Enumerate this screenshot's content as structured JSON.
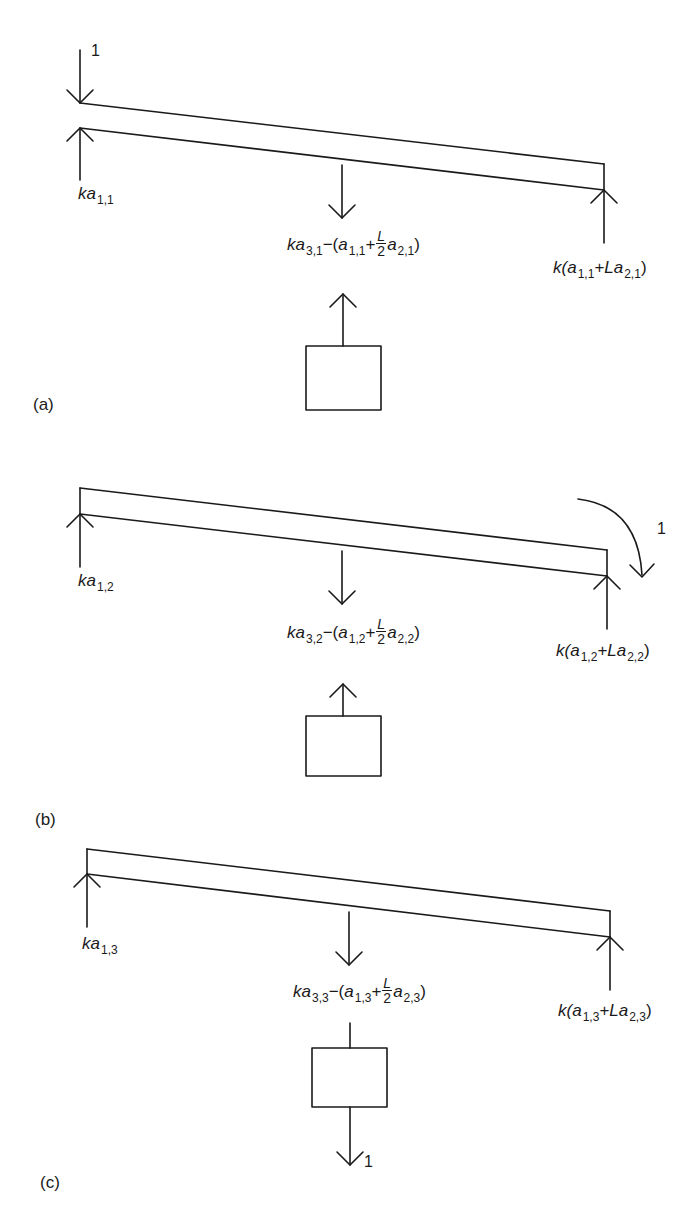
{
  "figure": {
    "panels": [
      {
        "id": "a",
        "label": "(a)",
        "unit_load_label": "1",
        "unit_load_type": "downward unit force at left end",
        "left_reaction": {
          "coef": "ka",
          "sub": "1,1"
        },
        "center_force": {
          "coef": "ka",
          "sub": "3,1",
          "term1_var": "a",
          "term1_sub": "1,1",
          "frac_num": "L",
          "frac_den": "2",
          "term2_var": "a",
          "term2_sub": "2,1"
        },
        "right_reaction": {
          "prefix": "k(",
          "term1_var": "a",
          "term1_sub": "1,1",
          "mid": "+L",
          "term2_var": "a",
          "term2_sub": "2,1",
          "suffix": ")"
        },
        "box_force_direction": "up"
      },
      {
        "id": "b",
        "label": "(b)",
        "unit_load_label": "1",
        "unit_load_type": "clockwise unit moment at right end",
        "left_reaction": {
          "coef": "ka",
          "sub": "1,2"
        },
        "center_force": {
          "coef": "ka",
          "sub": "3,2",
          "term1_var": "a",
          "term1_sub": "1,2",
          "frac_num": "L",
          "frac_den": "2",
          "term2_var": "a",
          "term2_sub": "2,2"
        },
        "right_reaction": {
          "prefix": "k(",
          "term1_var": "a",
          "term1_sub": "1,2",
          "mid": "+L",
          "term2_var": "a",
          "term2_sub": "2,2",
          "suffix": ")"
        },
        "box_force_direction": "up"
      },
      {
        "id": "c",
        "label": "(c)",
        "unit_load_label": "1",
        "unit_load_type": "downward unit force on mass",
        "left_reaction": {
          "coef": "ka",
          "sub": "1,3"
        },
        "center_force": {
          "coef": "ka",
          "sub": "3,3",
          "term1_var": "a",
          "term1_sub": "1,3",
          "frac_num": "L",
          "frac_den": "2",
          "term2_var": "a",
          "term2_sub": "2,3"
        },
        "right_reaction": {
          "prefix": "k(",
          "term1_var": "a",
          "term1_sub": "1,3",
          "mid": "+L",
          "term2_var": "a",
          "term2_sub": "2,3",
          "suffix": ")"
        },
        "box_force_direction": "down"
      }
    ],
    "symbols": {
      "minus_open": "−(",
      "plus": "+",
      "close": ")"
    },
    "colors": {
      "stroke": "#1a1a1a",
      "background": "#ffffff"
    }
  }
}
